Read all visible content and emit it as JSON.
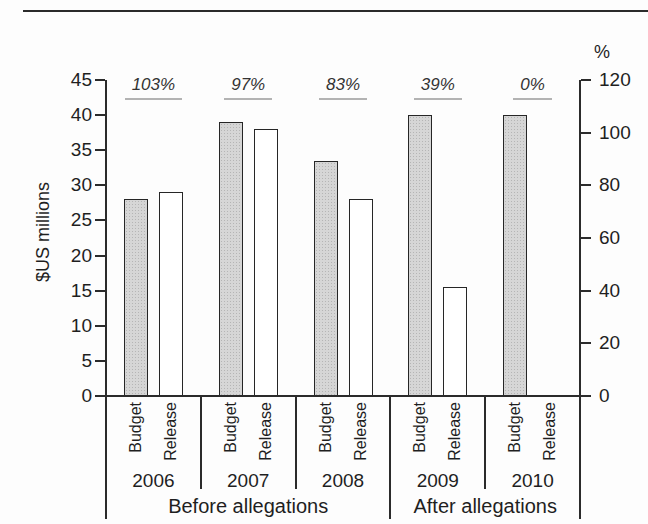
{
  "chart_data": {
    "type": "bar",
    "categories": [
      "2006",
      "2007",
      "2008",
      "2009",
      "2010"
    ],
    "series": [
      {
        "name": "Budget",
        "values": [
          28,
          39,
          33.5,
          40,
          40
        ]
      },
      {
        "name": "Release",
        "values": [
          29,
          38,
          28,
          15.5,
          0
        ]
      }
    ],
    "bar_pair_annotations": [
      "103%",
      "97%",
      "83%",
      "39%",
      "0%"
    ],
    "group_bands": [
      {
        "label": "Before allegations",
        "categories": [
          "2006",
          "2007",
          "2008"
        ]
      },
      {
        "label": "After allegations",
        "categories": [
          "2009",
          "2010"
        ]
      }
    ],
    "left_axis": {
      "title": "$US millions",
      "min": 0,
      "max": 45,
      "ticks": [
        45,
        40,
        35,
        30,
        25,
        20,
        15,
        10,
        5,
        0
      ]
    },
    "right_axis": {
      "title": "%",
      "min": 0,
      "max": 120,
      "ticks": [
        120,
        100,
        80,
        60,
        40,
        20,
        0
      ]
    },
    "legend_position": "none",
    "grid": false,
    "styles": {
      "budget_fill": "#d6d6d6",
      "budget_halftone_dot": "#b5b5b5",
      "release_fill": "#ffffff",
      "stroke": "#262626",
      "annotation_underline": "#b3b3b3",
      "line_color": "#2b2b2b"
    }
  }
}
